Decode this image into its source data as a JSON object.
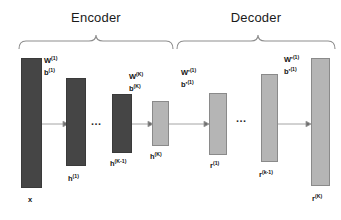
{
  "figure": {
    "type": "autoencoder-architecture-diagram",
    "background_color": "#ffffff",
    "encoder_color": "#454545",
    "decoder_color": "#b5b5b5"
  },
  "sections": {
    "encoder": {
      "label": "Encoder"
    },
    "decoder": {
      "label": "Decoder"
    }
  },
  "layers": [
    {
      "id": "input",
      "label": "x",
      "sup": "",
      "color": "#454545",
      "group": "encoder"
    },
    {
      "id": "h1",
      "label": "h",
      "sup": "(1)",
      "color": "#454545",
      "group": "encoder"
    },
    {
      "id": "hk_minus_1",
      "label": "h",
      "sup": "(K-1)",
      "color": "#454545",
      "group": "encoder"
    },
    {
      "id": "hk",
      "label": "h",
      "sup": "(K)",
      "color": "#b5b5b5",
      "group": "encoder"
    },
    {
      "id": "r1",
      "label": "r",
      "sup": "(1)",
      "color": "#b5b5b5",
      "group": "decoder"
    },
    {
      "id": "rk_minus_1",
      "label": "r",
      "sup": "(k-1)",
      "color": "#b5b5b5",
      "group": "decoder"
    },
    {
      "id": "rk",
      "label": "r",
      "sup": "(K)",
      "color": "#b5b5b5",
      "group": "decoder"
    }
  ],
  "parameters": [
    {
      "id": "p1",
      "weight": "W",
      "weight_sup": "(1)",
      "bias": "b",
      "bias_sup": "(1)"
    },
    {
      "id": "p2",
      "weight": "W",
      "weight_sup": "(K)",
      "bias": "b",
      "bias_sup": "(K)"
    },
    {
      "id": "p3",
      "weight": "W'",
      "weight_sup": "(1)",
      "bias": "b'",
      "bias_sup": "(1)"
    },
    {
      "id": "p4",
      "weight": "W'",
      "weight_sup": "(1)",
      "bias": "b'",
      "bias_sup": "(1)"
    }
  ],
  "ellipses": [
    {
      "id": "e1",
      "text": "..."
    },
    {
      "id": "e2",
      "text": "..."
    }
  ]
}
